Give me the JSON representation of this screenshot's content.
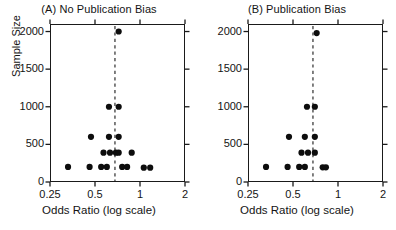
{
  "figure": {
    "xlabel": "Odds Ratio (log scale)",
    "ylabel": "Sample Size"
  },
  "chart_data": [
    {
      "type": "scatter",
      "title": "(A) No Publication Bias",
      "xlabel": "Odds Ratio (log scale)",
      "ylabel": "Sample Size",
      "xscale": "log",
      "xlim": [
        0.25,
        2
      ],
      "ylim": [
        0,
        2100
      ],
      "xticks": [
        0.25,
        0.5,
        1,
        2
      ],
      "xtick_labels": [
        "0.25",
        "0.5",
        "1",
        "2"
      ],
      "yticks": [
        0,
        500,
        1000,
        1500,
        2000
      ],
      "ytick_labels": [
        "0",
        "500",
        "1000",
        "1500",
        "2000"
      ],
      "grid": false,
      "legend": "none",
      "reference_line": {
        "x": 0.68,
        "style": "dashed",
        "color": "#1a1a1a"
      },
      "points": [
        {
          "x": 0.72,
          "y": 2000
        },
        {
          "x": 0.62,
          "y": 1000
        },
        {
          "x": 0.72,
          "y": 1000
        },
        {
          "x": 0.47,
          "y": 600
        },
        {
          "x": 0.62,
          "y": 600
        },
        {
          "x": 0.72,
          "y": 600
        },
        {
          "x": 0.57,
          "y": 390
        },
        {
          "x": 0.63,
          "y": 390
        },
        {
          "x": 0.69,
          "y": 390
        },
        {
          "x": 0.72,
          "y": 390
        },
        {
          "x": 0.88,
          "y": 390
        },
        {
          "x": 0.33,
          "y": 200
        },
        {
          "x": 0.46,
          "y": 200
        },
        {
          "x": 0.55,
          "y": 200
        },
        {
          "x": 0.6,
          "y": 200
        },
        {
          "x": 0.76,
          "y": 200
        },
        {
          "x": 0.82,
          "y": 200
        },
        {
          "x": 1.06,
          "y": 190
        },
        {
          "x": 1.17,
          "y": 190
        }
      ]
    },
    {
      "type": "scatter",
      "title": "(B) Publication Bias",
      "xlabel": "Odds Ratio (log scale)",
      "ylabel": "Sample Size",
      "xscale": "log",
      "xlim": [
        0.25,
        2
      ],
      "ylim": [
        0,
        2100
      ],
      "xticks": [
        0.25,
        0.5,
        1,
        2
      ],
      "xtick_labels": [
        "0.25",
        "0.5",
        "1",
        "2"
      ],
      "yticks": [
        0,
        500,
        1000,
        1500,
        2000
      ],
      "ytick_labels": [
        "0",
        "500",
        "1000",
        "1500",
        "2000"
      ],
      "grid": false,
      "legend": "none",
      "reference_line": {
        "x": 0.68,
        "style": "dashed",
        "color": "#1a1a1a"
      },
      "points": [
        {
          "x": 0.72,
          "y": 1980
        },
        {
          "x": 0.62,
          "y": 1000
        },
        {
          "x": 0.7,
          "y": 1000
        },
        {
          "x": 0.47,
          "y": 600
        },
        {
          "x": 0.6,
          "y": 600
        },
        {
          "x": 0.7,
          "y": 600
        },
        {
          "x": 0.57,
          "y": 390
        },
        {
          "x": 0.63,
          "y": 390
        },
        {
          "x": 0.7,
          "y": 390
        },
        {
          "x": 0.33,
          "y": 200
        },
        {
          "x": 0.46,
          "y": 200
        },
        {
          "x": 0.55,
          "y": 200
        },
        {
          "x": 0.6,
          "y": 200
        },
        {
          "x": 0.79,
          "y": 195
        },
        {
          "x": 0.83,
          "y": 195
        }
      ]
    }
  ]
}
